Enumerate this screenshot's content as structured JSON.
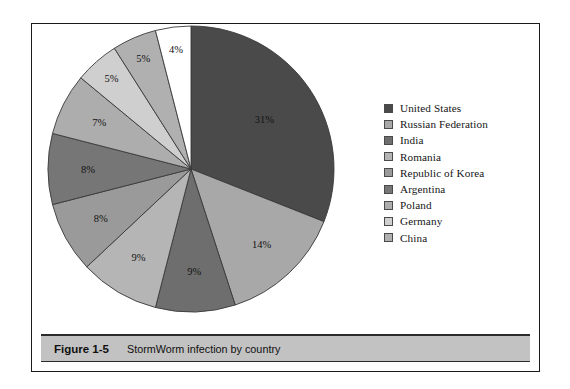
{
  "figure": {
    "caption_number": "Figure 1-5",
    "caption_text": "StormWorm infection by country"
  },
  "chart_data": {
    "type": "pie",
    "title": "StormWorm infection by country",
    "subtitle": "",
    "xlabel": "",
    "ylabel": "",
    "legend_position": "right",
    "grid": false,
    "unit": "percent",
    "categories": [
      "United States",
      "Russian Federation",
      "India",
      "Romania",
      "Republic of Korea",
      "Argentina",
      "Poland",
      "Germany",
      "China"
    ],
    "values": [
      31,
      14,
      9,
      9,
      8,
      8,
      7,
      5,
      5
    ],
    "data_labels": [
      "31%",
      "14%",
      "9%",
      "9%",
      "8%",
      "8%",
      "7%",
      "5%",
      "5%"
    ],
    "slices": [
      {
        "label": "United States",
        "value": 31,
        "data_label": "31%",
        "color": "#4a4a4a"
      },
      {
        "label": "Russian Federation",
        "value": 14,
        "data_label": "14%",
        "color": "#a8a8a8"
      },
      {
        "label": "India",
        "value": 9,
        "data_label": "9%",
        "color": "#6e6e6e"
      },
      {
        "label": "Romania",
        "value": 9,
        "data_label": "9%",
        "color": "#b5b5b5"
      },
      {
        "label": "Republic of Korea",
        "value": 8,
        "data_label": "8%",
        "color": "#9a9a9a"
      },
      {
        "label": "Argentina",
        "value": 8,
        "data_label": "8%",
        "color": "#767676"
      },
      {
        "label": "Poland",
        "value": 7,
        "data_label": "7%",
        "color": "#adadad"
      },
      {
        "label": "Germany",
        "value": 5,
        "data_label": "5%",
        "color": "#cfcfcf"
      },
      {
        "label": "China",
        "value": 5,
        "data_label": "5%",
        "color": "#b0b0b0"
      },
      {
        "label": "Other",
        "value": 4,
        "data_label": "4%",
        "color": "#ffffff"
      }
    ],
    "extra_slice_note": "4%"
  },
  "legend": {
    "items": [
      {
        "label": "United States",
        "color": "#4a4a4a"
      },
      {
        "label": "Russian Federation",
        "color": "#a8a8a8"
      },
      {
        "label": "India",
        "color": "#6e6e6e"
      },
      {
        "label": "Romania",
        "color": "#b5b5b5"
      },
      {
        "label": "Republic of Korea",
        "color": "#9a9a9a"
      },
      {
        "label": "Argentina",
        "color": "#767676"
      },
      {
        "label": "Poland",
        "color": "#adadad"
      },
      {
        "label": "Germany",
        "color": "#cfcfcf"
      },
      {
        "label": "China",
        "color": "#b0b0b0"
      }
    ]
  },
  "colors": {
    "frame": "#1a1a1a",
    "caption_bar": "#c2c2c2",
    "slice_outline": "#3a3a3a",
    "page_background": "#ffffff"
  }
}
